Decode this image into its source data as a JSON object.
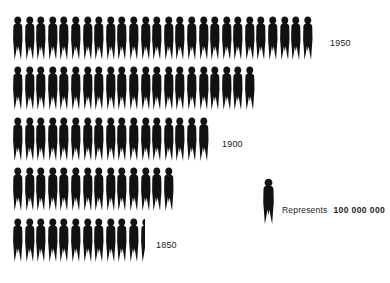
{
  "chart_data": {
    "type": "bar",
    "title": "",
    "subtitle": "",
    "xlabel": "",
    "ylabel": "",
    "unit_value": 100000000,
    "unit_value_text": "100 000 000",
    "icon": "person-pictogram-icon",
    "icon_color": "#111111",
    "legend_position": "middle-right",
    "legend_prefix": "Represents",
    "grid": false,
    "categories": [
      "1850",
      "",
      "1900",
      "",
      "1950"
    ],
    "rows": [
      {
        "label": "1950",
        "count": 26,
        "half": false,
        "value": 2600000000,
        "label_x": 330,
        "y": 16
      },
      {
        "label": "",
        "count": 21,
        "half": false,
        "value": 2100000000,
        "label_x": 0,
        "y": 66
      },
      {
        "label": "1900",
        "count": 17,
        "half": false,
        "value": 1700000000,
        "label_x": 222,
        "y": 117
      },
      {
        "label": "",
        "count": 14,
        "half": false,
        "value": 1400000000,
        "label_x": 0,
        "y": 167
      },
      {
        "label": "1850",
        "count": 11,
        "half": true,
        "value": 1150000000,
        "label_x": 156,
        "y": 218
      }
    ],
    "values": [
      1150000000,
      1400000000,
      1700000000,
      2100000000,
      2600000000
    ],
    "row_start_x": 12
  },
  "legend": {
    "prefix": "Represents",
    "value": "100 000 000"
  }
}
